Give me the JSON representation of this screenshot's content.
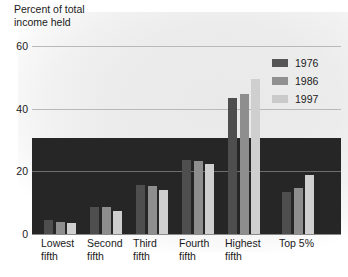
{
  "chart_data": {
    "type": "bar",
    "title": "Percent of total\nincome held",
    "xlabel": "",
    "ylabel": "Percent of total income held",
    "ylim": [
      0,
      60
    ],
    "yticks": [
      0,
      20,
      40,
      60
    ],
    "ytick_labels": [
      "0",
      "20",
      "40",
      "60"
    ],
    "grid": true,
    "legend_position": "top-right",
    "categories": [
      "Lowest\nfifth",
      "Second\nfifth",
      "Third\nfifth",
      "Fourth\nfifth",
      "Highest\nfifth",
      "Top 5%"
    ],
    "series": [
      {
        "name": "1976",
        "color": "#4e4e4e",
        "values": [
          4.4,
          8.6,
          15.6,
          23.5,
          43.3,
          13.4
        ]
      },
      {
        "name": "1986",
        "color": "#8e8e8e",
        "values": [
          3.9,
          8.5,
          15.3,
          23.4,
          44.6,
          14.7
        ]
      },
      {
        "name": "1997",
        "color": "#cfcfcf",
        "values": [
          3.6,
          7.5,
          14.2,
          22.3,
          49.4,
          18.9
        ]
      }
    ]
  },
  "legend": {
    "items": [
      {
        "label": "1976"
      },
      {
        "label": "1986"
      },
      {
        "label": "1997"
      }
    ]
  },
  "colors": {
    "series_1976": "#4e4e4e",
    "series_1986": "#8e8e8e",
    "series_1997": "#cfcfcf",
    "panel": "#262626",
    "gridline": "#b9b9b9",
    "background": "#ffffff"
  }
}
